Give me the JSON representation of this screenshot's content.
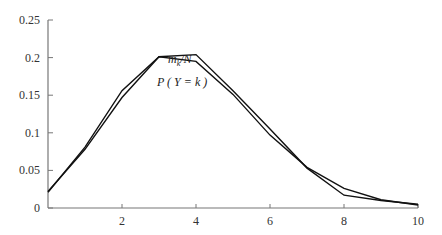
{
  "chart_data": {
    "type": "line",
    "title": "",
    "xlabel": "",
    "ylabel": "",
    "xlim": [
      0,
      10
    ],
    "ylim": [
      0,
      0.25
    ],
    "grid": false,
    "legend": "none (inline annotations)",
    "x_ticks": [
      2,
      4,
      6,
      8,
      10
    ],
    "x_tick_labels": [
      "2",
      "4",
      "6",
      "8",
      "10"
    ],
    "y_ticks": [
      0,
      0.05,
      0.1,
      0.15,
      0.2,
      0.25
    ],
    "y_tick_labels": [
      "0",
      "0.05",
      "0.1",
      "0.15",
      "0.2",
      "0.25"
    ],
    "x": [
      0,
      1,
      2,
      3,
      4,
      5,
      6,
      7,
      8,
      9,
      10
    ],
    "series": [
      {
        "name": "m_k/N",
        "values": [
          0.022,
          0.078,
          0.147,
          0.201,
          0.204,
          0.156,
          0.105,
          0.053,
          0.017,
          0.01,
          0.005
        ]
      },
      {
        "name": "P(Y=k)",
        "values": [
          0.021,
          0.081,
          0.156,
          0.201,
          0.195,
          0.151,
          0.097,
          0.054,
          0.026,
          0.011,
          0.004
        ]
      }
    ],
    "annotations": [
      {
        "text": "m_k/N",
        "near_x": 4,
        "position": "above curve"
      },
      {
        "text": "P ( Y = k )",
        "near_x": 4,
        "position": "below curve"
      }
    ]
  },
  "labels": {
    "annot_top_m": "m",
    "annot_top_sub": "k",
    "annot_top_rest": "/N",
    "annot_bottom": "P ( Y = k )"
  }
}
